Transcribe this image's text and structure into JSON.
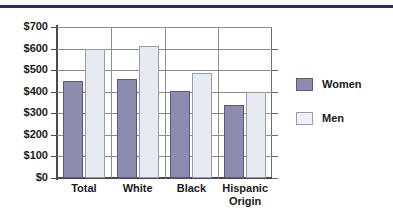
{
  "chart_data": {
    "type": "bar",
    "title": "",
    "xlabel": "",
    "ylabel": "",
    "ylim": [
      0,
      700
    ],
    "ytick_values": [
      0,
      100,
      200,
      300,
      400,
      500,
      600,
      700
    ],
    "ytick_labels": [
      "$0",
      "$100",
      "$200",
      "$300",
      "$400",
      "$500",
      "$600",
      "$700"
    ],
    "categories": [
      "Total",
      "White",
      "Black",
      "Hispanic Origin"
    ],
    "category_label_lines": [
      [
        "Total"
      ],
      [
        "White"
      ],
      [
        "Black"
      ],
      [
        "Hispanic",
        "Origin"
      ]
    ],
    "series": [
      {
        "name": "Women",
        "color": "#8b8cb0",
        "values": [
          450,
          460,
          405,
          340
        ]
      },
      {
        "name": "Men",
        "color": "#e8eaf2",
        "values": [
          600,
          610,
          485,
          400
        ]
      }
    ],
    "grid": {
      "horizontal": true,
      "vertical": true
    },
    "legend": {
      "position": "right",
      "entries": [
        "Women",
        "Men"
      ]
    }
  },
  "decor": {
    "top_rule_color": "#2b2b66"
  }
}
